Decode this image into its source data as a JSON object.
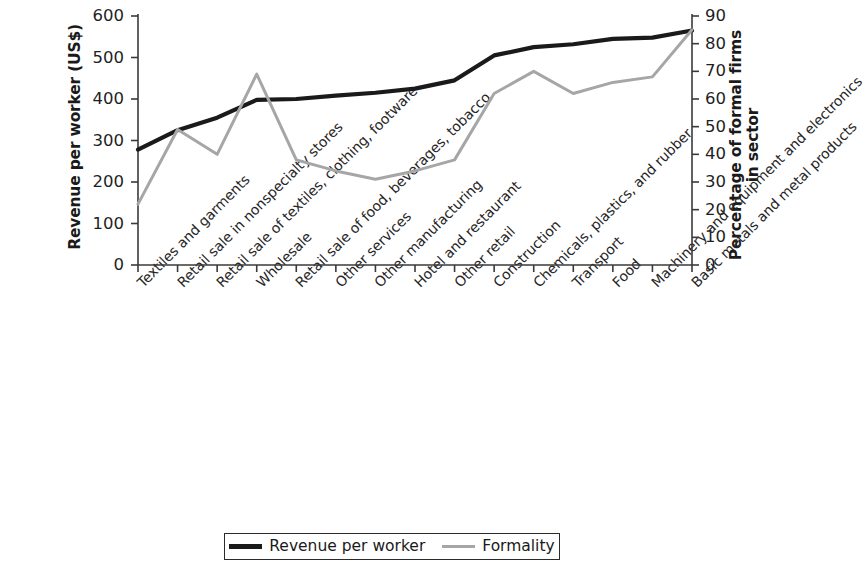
{
  "chart_data": {
    "type": "line",
    "title": "",
    "subtitle": "",
    "xlabel": "",
    "ylabel": "Revenue per worker (US$)",
    "y2label": "Percentage of formal firms in sector",
    "grid": false,
    "legend_position": "bottom",
    "ylim": [
      0,
      600
    ],
    "y2lim": [
      0,
      90
    ],
    "yticks": [
      "600",
      "500",
      "400",
      "300",
      "200",
      "100",
      "0"
    ],
    "ytick_values": [
      600,
      500,
      400,
      300,
      200,
      100,
      0
    ],
    "y2ticks": [
      "90",
      "80",
      "70",
      "60",
      "50",
      "40",
      "30",
      "20",
      "10",
      "0"
    ],
    "y2tick_values": [
      90,
      80,
      70,
      60,
      50,
      40,
      30,
      20,
      10,
      0
    ],
    "categories": [
      "Textiles and garments",
      "Retail sale in nonspecialty stores",
      "Retail sale of textiles, clothing, footware",
      "Wholesale",
      "Retail sale of food, beverages, tobacco",
      "Other services",
      "Other manufacturing",
      "Hotel and restaurant",
      "Other retail",
      "Construction",
      "Chemicals, plastics, and rubber",
      "Transport",
      "Food",
      "Machinery and equipment and electronics",
      "Basic metals and metal products"
    ],
    "series": [
      {
        "name": "Revenue per worker",
        "axis": "left",
        "color": "#1a1a1a",
        "width": 4.2,
        "values": [
          278,
          325,
          355,
          398,
          400,
          408,
          415,
          425,
          445,
          505,
          525,
          532,
          545,
          548,
          565
        ]
      },
      {
        "name": "Formality",
        "axis": "right",
        "color": "#a6a6a6",
        "width": 3.0,
        "values": [
          22,
          49,
          40,
          69,
          38,
          34,
          31,
          34,
          38,
          62,
          70,
          62,
          66,
          68,
          85
        ]
      }
    ]
  },
  "legend": {
    "items": [
      {
        "label": "Revenue per worker",
        "color": "#1a1a1a",
        "style": "thick"
      },
      {
        "label": "Formality",
        "color": "#a6a6a6",
        "style": "thin"
      }
    ]
  }
}
